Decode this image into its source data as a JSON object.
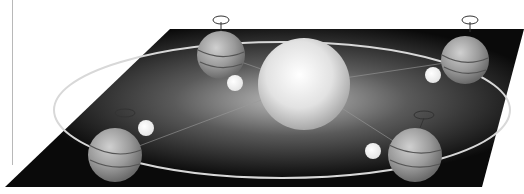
{
  "diagram": {
    "colors": {
      "background": "#ffffff",
      "plane": "#0a0a0a",
      "sun": "#e8e8e8",
      "earth": "#9a9a9a",
      "moon": "#ffffff",
      "orbit": "#d8d8d8"
    },
    "sun": {
      "cx": 304,
      "cy": 84,
      "r": 46
    },
    "orbit": {
      "cx": 282,
      "cy": 110,
      "rx": 228,
      "ry": 68
    },
    "earths": [
      {
        "name": "earth-top-left",
        "cx": 221,
        "cy": 55,
        "r": 24
      },
      {
        "name": "earth-top-right",
        "cx": 465,
        "cy": 60,
        "r": 24
      },
      {
        "name": "earth-bottom-left",
        "cx": 115,
        "cy": 155,
        "r": 27
      },
      {
        "name": "earth-bottom-right",
        "cx": 415,
        "cy": 155,
        "r": 27
      }
    ],
    "moons": [
      {
        "name": "moon-top-left",
        "cx": 235,
        "cy": 83,
        "r": 8
      },
      {
        "name": "moon-top-right",
        "cx": 433,
        "cy": 75,
        "r": 8
      },
      {
        "name": "moon-bottom-left",
        "cx": 146,
        "cy": 128,
        "r": 8
      },
      {
        "name": "moon-bottom-right",
        "cx": 373,
        "cy": 151,
        "r": 8
      }
    ]
  }
}
